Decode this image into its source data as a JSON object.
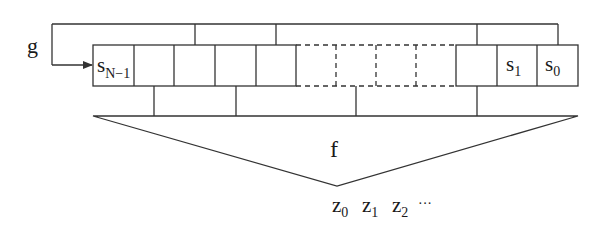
{
  "diagram": {
    "labels": {
      "feedback_function": "g",
      "filter_function": "f"
    },
    "register_cells": [
      {
        "label": "s",
        "sub": "N−1",
        "style": "solid"
      },
      {
        "label": "",
        "sub": "",
        "style": "solid"
      },
      {
        "label": "",
        "sub": "",
        "style": "solid"
      },
      {
        "label": "",
        "sub": "",
        "style": "solid"
      },
      {
        "label": "",
        "sub": "",
        "style": "solid"
      },
      {
        "label": "",
        "sub": "",
        "style": "dashed"
      },
      {
        "label": "",
        "sub": "",
        "style": "dashed"
      },
      {
        "label": "",
        "sub": "",
        "style": "dashed"
      },
      {
        "label": "",
        "sub": "",
        "style": "dashed"
      },
      {
        "label": "",
        "sub": "",
        "style": "solid"
      },
      {
        "label": "s",
        "sub": "1",
        "style": "solid"
      },
      {
        "label": "s",
        "sub": "0",
        "style": "solid"
      }
    ],
    "outputs": [
      {
        "label": "z",
        "sub": "0"
      },
      {
        "label": "z",
        "sub": "1"
      },
      {
        "label": "z",
        "sub": "2"
      }
    ],
    "outputs_ellipsis": "···",
    "colors": {
      "stroke": "#333333",
      "text": "#1a1a1a",
      "background": "#ffffff"
    }
  }
}
